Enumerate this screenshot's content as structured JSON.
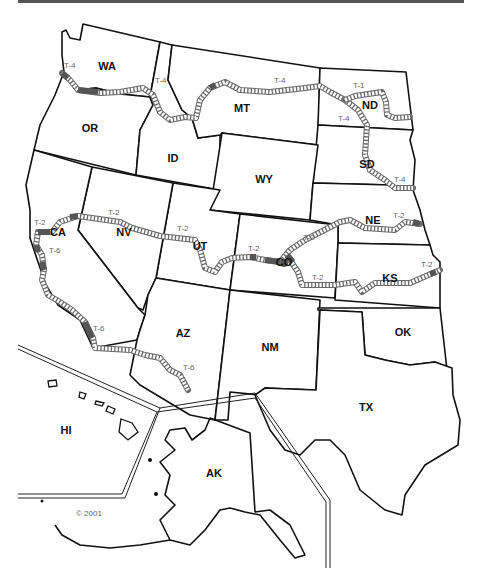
{
  "map": {
    "title": "Western United States Route Map",
    "copyright": "© 2001",
    "colors": {
      "route_fill": "#ffffff",
      "route_outline": "#6a6a6a",
      "route_highlight": "#555555",
      "border": "#111111",
      "label": "#111111",
      "route_label": "#666666"
    },
    "states": [
      {
        "abbr": "WA",
        "x": 107,
        "y": 70
      },
      {
        "abbr": "OR",
        "x": 90,
        "y": 132
      },
      {
        "abbr": "ID",
        "x": 173,
        "y": 158
      },
      {
        "abbr": "MT",
        "x": 268,
        "y": 110
      },
      {
        "abbr": "ND",
        "x": 370,
        "y": 109
      },
      {
        "abbr": "SD",
        "x": 367,
        "y": 168
      },
      {
        "abbr": "WY",
        "x": 264,
        "y": 183
      },
      {
        "abbr": "NE",
        "x": 373,
        "y": 224
      },
      {
        "abbr": "NV",
        "x": 124,
        "y": 236
      },
      {
        "abbr": "CA",
        "x": 61,
        "y": 236
      },
      {
        "abbr": "UT",
        "x": 196,
        "y": 248
      },
      {
        "abbr": "CO",
        "x": 284,
        "y": 264
      },
      {
        "abbr": "KS",
        "x": 390,
        "y": 282
      },
      {
        "abbr": "AZ",
        "x": 181,
        "y": 337
      },
      {
        "abbr": "NM",
        "x": 270,
        "y": 351
      },
      {
        "abbr": "OK",
        "x": 403,
        "y": 336
      },
      {
        "abbr": "TX",
        "x": 366,
        "y": 411
      },
      {
        "abbr": "HI",
        "x": 66,
        "y": 434
      },
      {
        "abbr": "AK",
        "x": 214,
        "y": 477
      }
    ],
    "routes": [
      {
        "id": "T-4",
        "segment": "WA-OR / ID / MT / ND-SD",
        "labels": [
          {
            "text": "T-4",
            "x": 64,
            "y": 68
          },
          {
            "text": "T-4",
            "x": 155,
            "y": 83
          },
          {
            "text": "T-4",
            "x": 274,
            "y": 83
          },
          {
            "text": "T-4",
            "x": 338,
            "y": 121
          },
          {
            "text": "T-4",
            "x": 394,
            "y": 182
          }
        ]
      },
      {
        "id": "T-1",
        "segment": "ND",
        "labels": [
          {
            "text": "T-1",
            "x": 353,
            "y": 88
          }
        ]
      },
      {
        "id": "T-2",
        "segment": "CA / NV / UT / CO / NE / KS",
        "labels": [
          {
            "text": "T-2",
            "x": 34,
            "y": 225
          },
          {
            "text": "T-2",
            "x": 108,
            "y": 215
          },
          {
            "text": "T-2",
            "x": 177,
            "y": 231
          },
          {
            "text": "T-2",
            "x": 248,
            "y": 251
          },
          {
            "text": "T-2",
            "x": 303,
            "y": 240
          },
          {
            "text": "T-2",
            "x": 312,
            "y": 280
          },
          {
            "text": "T-2",
            "x": 393,
            "y": 218
          },
          {
            "text": "T-2",
            "x": 421,
            "y": 267
          }
        ]
      },
      {
        "id": "T-6",
        "segment": "CA / AZ",
        "labels": [
          {
            "text": "T-6",
            "x": 49,
            "y": 253
          },
          {
            "text": "T-6",
            "x": 93,
            "y": 331
          },
          {
            "text": "T-6",
            "x": 183,
            "y": 370
          }
        ]
      }
    ]
  }
}
